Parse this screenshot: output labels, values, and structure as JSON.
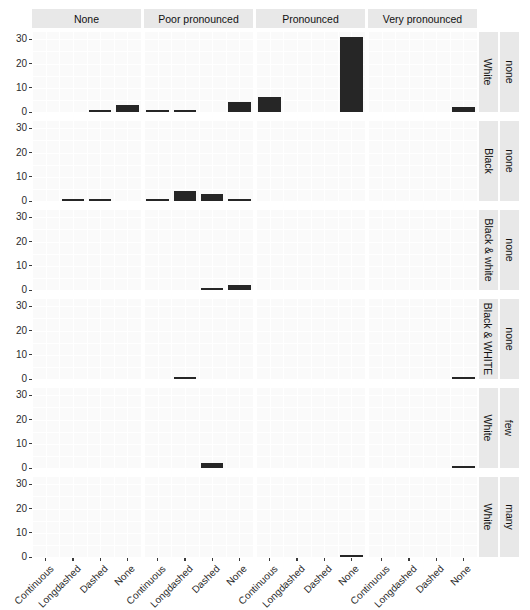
{
  "chart_data": {
    "type": "bar",
    "title": "",
    "subtitle": "",
    "xlabel": "",
    "ylabel": "",
    "ylim": [
      0,
      33
    ],
    "yticks": [
      0,
      10,
      20,
      30
    ],
    "ytick_labels": [
      "0",
      "10",
      "20",
      "30"
    ],
    "grid": true,
    "legend_position": "none",
    "bar_color": "#262626",
    "panel_bg": "#fafafa",
    "strip_bg": "#e8e8e8",
    "categories": [
      "Continuous",
      "Longdashed",
      "Dashed",
      "None"
    ],
    "col_facets": [
      "None",
      "Poor pronounced",
      "Pronounced",
      "Very pronounced"
    ],
    "row_facets_inner": [
      "White",
      "Black",
      "Black & white",
      "Black & WHITE",
      "White",
      "White"
    ],
    "row_facets_outer": [
      "none",
      "none",
      "none",
      "none",
      "few",
      "many"
    ],
    "panels": [
      {
        "row_inner": "White",
        "row_outer": "none",
        "cells": [
          {
            "col": "None",
            "values": [
              0,
              0,
              1,
              3
            ]
          },
          {
            "col": "Poor pronounced",
            "values": [
              1,
              1,
              0,
              4
            ]
          },
          {
            "col": "Pronounced",
            "values": [
              6,
              0,
              0,
              31
            ]
          },
          {
            "col": "Very pronounced",
            "values": [
              0,
              0,
              0,
              2
            ]
          }
        ]
      },
      {
        "row_inner": "Black",
        "row_outer": "none",
        "cells": [
          {
            "col": "None",
            "values": [
              0,
              1,
              1,
              0
            ]
          },
          {
            "col": "Poor pronounced",
            "values": [
              1,
              4,
              3,
              1
            ]
          },
          {
            "col": "Pronounced",
            "values": [
              0,
              0,
              0,
              0
            ]
          },
          {
            "col": "Very pronounced",
            "values": [
              0,
              0,
              0,
              0
            ]
          }
        ]
      },
      {
        "row_inner": "Black & white",
        "row_outer": "none",
        "cells": [
          {
            "col": "None",
            "values": [
              0,
              0,
              0,
              0
            ]
          },
          {
            "col": "Poor pronounced",
            "values": [
              0,
              0,
              1,
              2
            ]
          },
          {
            "col": "Pronounced",
            "values": [
              0,
              0,
              0,
              0
            ]
          },
          {
            "col": "Very pronounced",
            "values": [
              0,
              0,
              0,
              0
            ]
          }
        ]
      },
      {
        "row_inner": "Black & WHITE",
        "row_outer": "none",
        "cells": [
          {
            "col": "None",
            "values": [
              0,
              0,
              0,
              0
            ]
          },
          {
            "col": "Poor pronounced",
            "values": [
              0,
              1,
              0,
              0
            ]
          },
          {
            "col": "Pronounced",
            "values": [
              0,
              0,
              0,
              0
            ]
          },
          {
            "col": "Very pronounced",
            "values": [
              0,
              0,
              0,
              1
            ]
          }
        ]
      },
      {
        "row_inner": "White",
        "row_outer": "few",
        "cells": [
          {
            "col": "None",
            "values": [
              0,
              0,
              0,
              0
            ]
          },
          {
            "col": "Poor pronounced",
            "values": [
              0,
              0,
              2,
              0
            ]
          },
          {
            "col": "Pronounced",
            "values": [
              0,
              0,
              0,
              0
            ]
          },
          {
            "col": "Very pronounced",
            "values": [
              0,
              0,
              0,
              1
            ]
          }
        ]
      },
      {
        "row_inner": "White",
        "row_outer": "many",
        "cells": [
          {
            "col": "None",
            "values": [
              0,
              0,
              0,
              0
            ]
          },
          {
            "col": "Poor pronounced",
            "values": [
              0,
              0,
              0,
              0
            ]
          },
          {
            "col": "Pronounced",
            "values": [
              0,
              0,
              0,
              1
            ]
          },
          {
            "col": "Very pronounced",
            "values": [
              0,
              0,
              0,
              0
            ]
          }
        ]
      }
    ]
  }
}
